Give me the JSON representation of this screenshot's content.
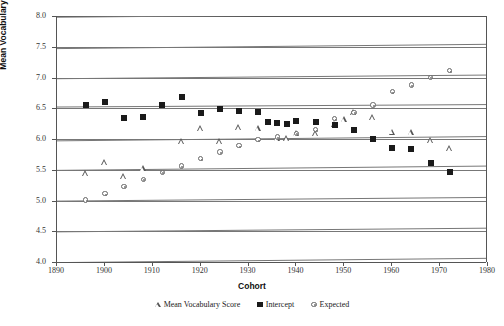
{
  "chart_data": {
    "type": "scatter",
    "title": "",
    "xlabel": "Cohort",
    "ylabel": "Mean Vocabulary Score",
    "xlim": [
      1890,
      1980
    ],
    "ylim": [
      4.0,
      8.0
    ],
    "grid": true,
    "legend_position": "bottom",
    "xticks": [
      1890,
      1900,
      1910,
      1920,
      1930,
      1940,
      1950,
      1960,
      1970,
      1980
    ],
    "yticks": [
      "8.0",
      "7.5",
      "7.0",
      "6.5",
      "6.0",
      "5.5",
      "5.0",
      "4.5",
      "4.0"
    ],
    "series": [
      {
        "name": "Mean Vocabulary Score",
        "marker": "triangle",
        "points": [
          [
            1896,
            5.44
          ],
          [
            1900,
            5.63
          ],
          [
            1904,
            5.4
          ],
          [
            1908,
            5.53
          ],
          [
            1916,
            5.97
          ],
          [
            1920,
            6.18
          ],
          [
            1924,
            5.97
          ],
          [
            1928,
            6.19
          ],
          [
            1932,
            6.17
          ],
          [
            1936,
            6.02
          ],
          [
            1938,
            6.02
          ],
          [
            1940,
            6.1
          ],
          [
            1944,
            6.09
          ],
          [
            1948,
            6.24
          ],
          [
            1950,
            6.33
          ],
          [
            1952,
            6.43
          ],
          [
            1956,
            6.35
          ],
          [
            1960,
            6.12
          ],
          [
            1964,
            6.11
          ],
          [
            1968,
            5.98
          ],
          [
            1972,
            5.85
          ]
        ]
      },
      {
        "name": "Intercept",
        "marker": "square",
        "points": [
          [
            1896,
            6.55
          ],
          [
            1900,
            6.6
          ],
          [
            1904,
            6.34
          ],
          [
            1908,
            6.35
          ],
          [
            1912,
            6.55
          ],
          [
            1916,
            6.68
          ],
          [
            1920,
            6.42
          ],
          [
            1924,
            6.48
          ],
          [
            1928,
            6.46
          ],
          [
            1932,
            6.44
          ],
          [
            1934,
            6.28
          ],
          [
            1936,
            6.26
          ],
          [
            1938,
            6.25
          ],
          [
            1940,
            6.29
          ],
          [
            1944,
            6.27
          ],
          [
            1948,
            6.22
          ],
          [
            1952,
            6.15
          ],
          [
            1956,
            6.0
          ],
          [
            1960,
            5.85
          ],
          [
            1964,
            5.83
          ],
          [
            1968,
            5.61
          ],
          [
            1972,
            5.47
          ]
        ]
      },
      {
        "name": "Expected",
        "marker": "circle",
        "points": [
          [
            1896,
            5.01
          ],
          [
            1900,
            5.11
          ],
          [
            1904,
            5.23
          ],
          [
            1908,
            5.34
          ],
          [
            1912,
            5.46
          ],
          [
            1916,
            5.56
          ],
          [
            1920,
            5.68
          ],
          [
            1924,
            5.79
          ],
          [
            1928,
            5.89
          ],
          [
            1932,
            5.99
          ],
          [
            1936,
            6.03
          ],
          [
            1940,
            6.09
          ],
          [
            1944,
            6.15
          ],
          [
            1948,
            6.33
          ],
          [
            1952,
            6.43
          ],
          [
            1956,
            6.55
          ],
          [
            1960,
            6.77
          ],
          [
            1964,
            6.88
          ],
          [
            1968,
            7.0
          ],
          [
            1972,
            7.11
          ]
        ]
      }
    ],
    "trendlines": [
      {
        "name": "intercept-fit",
        "x1": 1890,
        "y1": 6.52,
        "x2": 1980,
        "y2": 6.56
      },
      {
        "name": "mean-vocabulary-fit",
        "x1": 1890,
        "y1": 5.97,
        "x2": 1980,
        "y2": 6.04
      },
      {
        "name": "expected-fit",
        "x1": 1890,
        "y1": 5.49,
        "x2": 1980,
        "y2": 5.56
      },
      {
        "name": "baseline-fit",
        "x1": 1890,
        "y1": 4.99,
        "x2": 1980,
        "y2": 5.05
      },
      {
        "name": "upper-fit-a",
        "x1": 1890,
        "y1": 7.98,
        "x2": 1980,
        "y2": 8.04
      },
      {
        "name": "upper-fit-b",
        "x1": 1890,
        "y1": 7.47,
        "x2": 1980,
        "y2": 7.54
      },
      {
        "name": "upper-fit-c",
        "x1": 1890,
        "y1": 6.98,
        "x2": 1980,
        "y2": 7.04
      },
      {
        "name": "lower-fit-a",
        "x1": 1890,
        "y1": 4.49,
        "x2": 1980,
        "y2": 4.55
      },
      {
        "name": "lower-fit-b",
        "x1": 1890,
        "y1": 3.99,
        "x2": 1980,
        "y2": 4.06
      }
    ]
  },
  "axes": {
    "y_title": "Mean Vocabulary Score",
    "x_title": "Cohort"
  },
  "legend": {
    "items": [
      {
        "label": "Mean Vocabulary Score",
        "marker": "triangle-icon"
      },
      {
        "label": "Intercept",
        "marker": "square-icon"
      },
      {
        "label": "Expected",
        "marker": "circle-icon"
      }
    ]
  },
  "colors": {
    "marker_dark": "#1a1a1a",
    "marker_outline": "#555555",
    "gridline": "#777777",
    "axis": "#555555",
    "background": "#ffffff"
  }
}
